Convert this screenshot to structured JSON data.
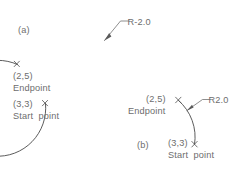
{
  "drawing": {
    "title": "Arc radius sign comparison",
    "background_color": "#ffffff",
    "line_color": "#4a4a4a",
    "text_color": "#6d6d6d"
  },
  "figure_a": {
    "label": "(a)",
    "radius_label": "R-2.0",
    "radius_value": -2.0,
    "arc_type": "major-arc",
    "endpoint": {
      "coords": "(2,5)",
      "caption": "Endpoint",
      "marker": "x-mark"
    },
    "startpoint": {
      "coords": "(3,3)",
      "caption": "Start  point",
      "marker": "x-mark"
    }
  },
  "figure_b": {
    "label": "(b)",
    "radius_label": "R2.0",
    "radius_value": 2.0,
    "arc_type": "minor-arc",
    "endpoint": {
      "coords": "(2,5)",
      "caption": "Endpoint",
      "marker": "x-mark"
    },
    "startpoint": {
      "coords": "(3,3)",
      "caption": "Start  point",
      "marker": "x-mark"
    }
  }
}
